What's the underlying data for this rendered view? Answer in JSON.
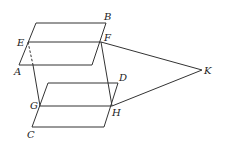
{
  "diagram": {
    "type": "geometry",
    "colors": {
      "line": "#333333",
      "label": "#222222",
      "background": "#ffffff"
    },
    "labels": {
      "A": "A",
      "B": "B",
      "C": "C",
      "D": "D",
      "E": "E",
      "F": "F",
      "G": "G",
      "H": "H",
      "K": "K"
    },
    "points": {
      "A": [
        19,
        65
      ],
      "B": [
        106,
        23
      ],
      "C": [
        32,
        127
      ],
      "D": [
        118,
        83
      ],
      "E": [
        28,
        42
      ],
      "F": [
        101,
        42
      ],
      "G": [
        40,
        106
      ],
      "H": [
        112,
        106
      ],
      "K": [
        202,
        70
      ]
    },
    "planes": [
      {
        "name": "upper-plane",
        "vertices": [
          "TL(36,23)",
          "B",
          "BR(92,65)",
          "A"
        ],
        "mid_line": [
          "E",
          "F"
        ]
      },
      {
        "name": "lower-plane",
        "vertices": [
          "TL(48,83)",
          "D",
          "BR(104,127)",
          "C"
        ],
        "mid_line": [
          "G",
          "H"
        ]
      }
    ],
    "segments": [
      {
        "from": "E",
        "to": "G",
        "style": "dashed-then-solid"
      },
      {
        "from": "F",
        "to": "H",
        "style": "solid"
      },
      {
        "from": "F",
        "to": "K",
        "style": "solid"
      },
      {
        "from": "H",
        "to": "K",
        "style": "solid"
      }
    ]
  }
}
